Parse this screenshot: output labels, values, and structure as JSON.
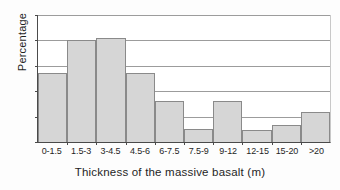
{
  "chart_data": {
    "type": "bar",
    "title": "",
    "xlabel": "Thickness of the massive basalt (m)",
    "ylabel": "Percentage",
    "categories": [
      "0-1.5",
      "1.5-3",
      "3-4.5",
      "4.5-6",
      "6-7.5",
      "7.5-9",
      "9-12",
      "12-15",
      "15-20",
      ">20"
    ],
    "values": [
      13.5,
      20,
      20.5,
      13.5,
      8,
      2.5,
      8,
      2.3,
      3.3,
      6
    ],
    "ylim": [
      0,
      25
    ],
    "yticks": [
      0,
      5,
      10,
      15,
      20,
      25
    ],
    "ytick_labels": [
      "0",
      "5",
      "10",
      "15",
      "20",
      "25"
    ],
    "grid": "horizontal",
    "legend": "none",
    "bar_fill_color": "#d6d6d6",
    "bar_edge_color": "#8a8a8a",
    "axis_color": "#4a4a4a",
    "gridline_color": "#9c9c9c",
    "background_color": "#ffffff"
  }
}
